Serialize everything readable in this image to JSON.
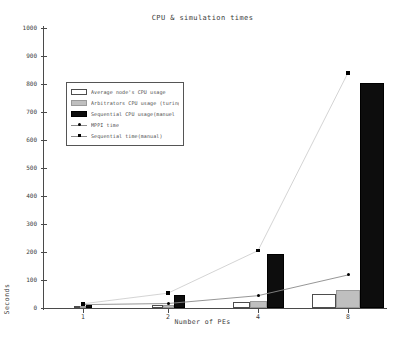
{
  "chart_data": {
    "type": "bar",
    "title": "CPU & simulation times",
    "xlabel": "Number of PEs",
    "ylabel": "Seconds",
    "categories": [
      "1",
      "2",
      "4",
      "8"
    ],
    "x_positions": [
      1,
      2,
      4,
      8
    ],
    "ylim": [
      0,
      1000
    ],
    "yticks": [
      0,
      100,
      200,
      300,
      400,
      500,
      600,
      700,
      800,
      900,
      1000
    ],
    "ytick_labels": [
      "0",
      "100",
      "200",
      "300",
      "400",
      "500",
      "600",
      "700",
      "800",
      "900",
      "1000"
    ],
    "grid": false,
    "legend_position": "upper left",
    "series": [
      {
        "name": "Average node's CPU usage",
        "kind": "bar",
        "color": "#ffffff",
        "edge_color": "#4d4d4d",
        "values": [
          3,
          10,
          22,
          50
        ]
      },
      {
        "name": "Arbitrators CPU usage (turing)",
        "kind": "bar",
        "color": "#bfbfbf",
        "edge_color": "#9a9a9a",
        "values": [
          4,
          12,
          25,
          65
        ]
      },
      {
        "name": "Sequential CPU usage(manuel)",
        "kind": "bar",
        "color": "#0d0d0d",
        "edge_color": "#000000",
        "values": [
          12,
          45,
          192,
          805
        ]
      },
      {
        "name": "MPPI time",
        "kind": "line",
        "marker": "circle",
        "color": "#000000",
        "line_color": "#8a8a8a",
        "values": [
          12,
          16,
          44,
          118
        ]
      },
      {
        "name": "Sequential time(manual)",
        "kind": "line",
        "marker": "square",
        "color": "#000000",
        "line_color": "#cfcfcf",
        "values": [
          15,
          53,
          205,
          840
        ]
      }
    ]
  },
  "legend": {
    "entries": [
      {
        "label": "Average node's CPU usage",
        "swatch": "white-swatch"
      },
      {
        "label": "Arbitrators CPU usage (turing",
        "swatch": "gray-swatch"
      },
      {
        "label": "Sequential CPU usage(manuel",
        "swatch": "black-swatch"
      },
      {
        "label": "MPPI time",
        "swatch": "circle-marker-icon"
      },
      {
        "label": "Sequential time(manual)",
        "swatch": "square-marker-icon"
      }
    ]
  }
}
